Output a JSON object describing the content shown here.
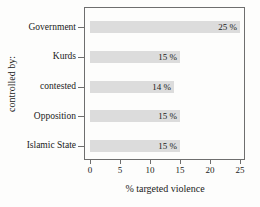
{
  "chart_data": {
    "type": "bar",
    "orientation": "horizontal",
    "title": "",
    "xlabel": "% targeted violence",
    "ylabel": "controlled by:",
    "categories": [
      "Government",
      "Kurds",
      "contested",
      "Opposition",
      "Islamic State"
    ],
    "values": [
      25,
      15,
      14,
      15,
      15
    ],
    "value_labels": [
      "25 %",
      "15 %",
      "14 %",
      "15 %",
      "15 %"
    ],
    "xlim": [
      0,
      25
    ],
    "x_ticks": [
      0,
      5,
      10,
      15,
      20,
      25
    ],
    "x_tick_labels": [
      "0",
      "5",
      "10",
      "15",
      "20",
      "25"
    ],
    "grid": false,
    "legend": "none",
    "bar_color": "#dcdcdc",
    "frame_color": "#6e6e6e",
    "text_color": "#1a1a1a"
  }
}
